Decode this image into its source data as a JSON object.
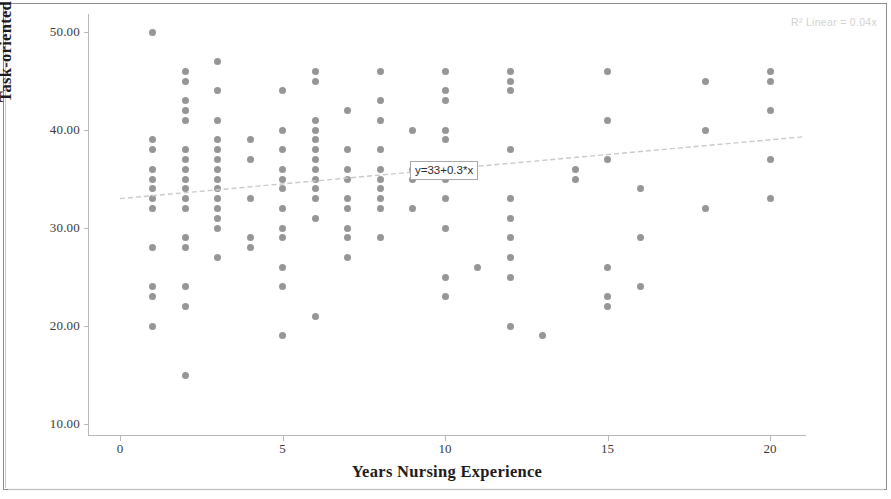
{
  "chart_data": {
    "type": "scatter",
    "title": "",
    "xlabel": "Years Nursing Experience",
    "ylabel": "Task-oriented Leadership",
    "xlim": [
      -0.5,
      21.0
    ],
    "ylim": [
      7.5,
      52.0
    ],
    "xticks": [
      0,
      5,
      10,
      15,
      20
    ],
    "xtick_labels": [
      "0",
      "5",
      "10",
      "15",
      "20"
    ],
    "yticks": [
      10,
      20,
      30,
      40,
      50
    ],
    "ytick_labels": [
      "10.00",
      "20.00",
      "30.00",
      "40.00",
      "50.00"
    ],
    "grid": false,
    "legend": null,
    "marker_color": "#8d8d8d",
    "fit_line": {
      "type": "linear",
      "equation_label": "y=33+0.3*x",
      "intercept": 33,
      "slope": 0.3,
      "r_squared_label": "R² Linear = 0.04x",
      "color": "#c9c9c9",
      "x_start": 0,
      "x_end": 21
    },
    "points": [
      [
        1,
        50
      ],
      [
        1,
        39
      ],
      [
        1,
        38
      ],
      [
        1,
        36
      ],
      [
        1,
        35
      ],
      [
        1,
        34
      ],
      [
        1,
        33
      ],
      [
        1,
        32
      ],
      [
        1,
        28
      ],
      [
        1,
        24
      ],
      [
        1,
        23
      ],
      [
        1,
        20
      ],
      [
        2,
        46
      ],
      [
        2,
        45
      ],
      [
        2,
        43
      ],
      [
        2,
        42
      ],
      [
        2,
        41
      ],
      [
        2,
        38
      ],
      [
        2,
        37
      ],
      [
        2,
        36
      ],
      [
        2,
        35
      ],
      [
        2,
        34
      ],
      [
        2,
        33
      ],
      [
        2,
        32
      ],
      [
        2,
        29
      ],
      [
        2,
        28
      ],
      [
        2,
        24
      ],
      [
        2,
        22
      ],
      [
        2,
        15
      ],
      [
        3,
        47
      ],
      [
        3,
        44
      ],
      [
        3,
        41
      ],
      [
        3,
        39
      ],
      [
        3,
        38
      ],
      [
        3,
        37
      ],
      [
        3,
        36
      ],
      [
        3,
        35
      ],
      [
        3,
        34
      ],
      [
        3,
        33
      ],
      [
        3,
        32
      ],
      [
        3,
        31
      ],
      [
        3,
        30
      ],
      [
        3,
        27
      ],
      [
        4,
        39
      ],
      [
        4,
        37
      ],
      [
        4,
        33
      ],
      [
        4,
        29
      ],
      [
        4,
        28
      ],
      [
        5,
        44
      ],
      [
        5,
        40
      ],
      [
        5,
        38
      ],
      [
        5,
        36
      ],
      [
        5,
        35
      ],
      [
        5,
        34
      ],
      [
        5,
        32
      ],
      [
        5,
        30
      ],
      [
        5,
        29
      ],
      [
        5,
        26
      ],
      [
        5,
        24
      ],
      [
        5,
        19
      ],
      [
        6,
        46
      ],
      [
        6,
        45
      ],
      [
        6,
        41
      ],
      [
        6,
        40
      ],
      [
        6,
        39
      ],
      [
        6,
        38
      ],
      [
        6,
        37
      ],
      [
        6,
        36
      ],
      [
        6,
        35
      ],
      [
        6,
        34
      ],
      [
        6,
        33
      ],
      [
        6,
        31
      ],
      [
        6,
        21
      ],
      [
        7,
        42
      ],
      [
        7,
        38
      ],
      [
        7,
        36
      ],
      [
        7,
        35
      ],
      [
        7,
        33
      ],
      [
        7,
        32
      ],
      [
        7,
        30
      ],
      [
        7,
        29
      ],
      [
        7,
        27
      ],
      [
        8,
        46
      ],
      [
        8,
        43
      ],
      [
        8,
        41
      ],
      [
        8,
        38
      ],
      [
        8,
        36
      ],
      [
        8,
        35
      ],
      [
        8,
        34
      ],
      [
        8,
        33
      ],
      [
        8,
        32
      ],
      [
        8,
        29
      ],
      [
        9,
        40
      ],
      [
        9,
        36
      ],
      [
        9,
        35
      ],
      [
        9,
        32
      ],
      [
        10,
        46
      ],
      [
        10,
        44
      ],
      [
        10,
        43
      ],
      [
        10,
        40
      ],
      [
        10,
        39
      ],
      [
        10,
        36
      ],
      [
        10,
        35
      ],
      [
        10,
        33
      ],
      [
        10,
        30
      ],
      [
        10,
        25
      ],
      [
        10,
        23
      ],
      [
        11,
        26
      ],
      [
        12,
        46
      ],
      [
        12,
        45
      ],
      [
        12,
        44
      ],
      [
        12,
        38
      ],
      [
        12,
        33
      ],
      [
        12,
        31
      ],
      [
        12,
        29
      ],
      [
        12,
        27
      ],
      [
        12,
        25
      ],
      [
        12,
        20
      ],
      [
        13,
        19
      ],
      [
        14,
        36
      ],
      [
        14,
        35
      ],
      [
        15,
        46
      ],
      [
        15,
        41
      ],
      [
        15,
        37
      ],
      [
        15,
        26
      ],
      [
        15,
        23
      ],
      [
        15,
        22
      ],
      [
        16,
        34
      ],
      [
        16,
        29
      ],
      [
        16,
        24
      ],
      [
        18,
        45
      ],
      [
        18,
        40
      ],
      [
        18,
        32
      ],
      [
        20,
        46
      ],
      [
        20,
        45
      ],
      [
        20,
        42
      ],
      [
        20,
        37
      ],
      [
        20,
        33
      ]
    ]
  }
}
